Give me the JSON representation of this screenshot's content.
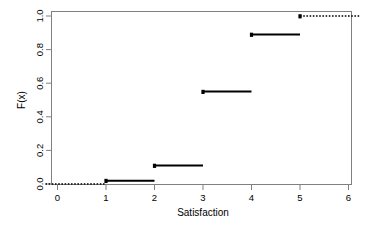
{
  "chart_data": {
    "type": "line",
    "plot_style": "step-ecdf",
    "title": "",
    "subtitle": "",
    "xlabel": "Satisfaction",
    "ylabel": "F(x)",
    "xlim": [
      -0.25,
      6.25
    ],
    "ylim": [
      0.0,
      1.0
    ],
    "grid": false,
    "legend": null,
    "xticks": [
      0,
      1,
      2,
      3,
      4,
      5,
      6
    ],
    "xtick_labels": [
      "0",
      "1",
      "2",
      "3",
      "4",
      "5",
      "6"
    ],
    "yticks": [
      0.0,
      0.2,
      0.4,
      0.6,
      0.8,
      1.0
    ],
    "ytick_labels": [
      "0.0",
      "0.2",
      "0.4",
      "0.6",
      "0.8",
      "1.0"
    ],
    "x": [
      1,
      2,
      3,
      4,
      5
    ],
    "values": [
      0.02,
      0.11,
      0.55,
      0.89,
      1.0
    ],
    "steps": [
      {
        "x_start": -0.25,
        "x_end": 1,
        "y": 0.0,
        "dashed": true
      },
      {
        "x_start": 1,
        "x_end": 2,
        "y": 0.02,
        "dashed": false
      },
      {
        "x_start": 2,
        "x_end": 3,
        "y": 0.11,
        "dashed": false
      },
      {
        "x_start": 3,
        "x_end": 4,
        "y": 0.55,
        "dashed": false
      },
      {
        "x_start": 4,
        "x_end": 5,
        "y": 0.89,
        "dashed": false
      },
      {
        "x_start": 5,
        "x_end": 6.25,
        "y": 1.0,
        "dashed": true
      }
    ],
    "jump_points": [
      {
        "x": 1,
        "y": 0.02
      },
      {
        "x": 2,
        "y": 0.11
      },
      {
        "x": 3,
        "y": 0.55
      },
      {
        "x": 4,
        "y": 0.89
      },
      {
        "x": 5,
        "y": 1.0
      }
    ],
    "colors": {
      "line": "#000000",
      "axis": "#808080",
      "text": "#000000",
      "background": "#ffffff"
    }
  }
}
